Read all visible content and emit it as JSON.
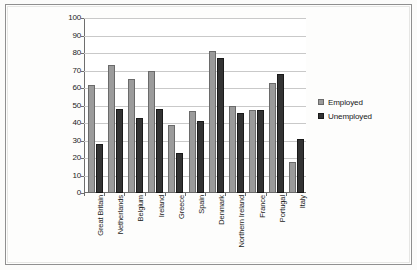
{
  "chart_data": {
    "type": "bar",
    "title": "",
    "xlabel": "",
    "ylabel": "",
    "ylim": [
      0,
      100
    ],
    "ytick_step": 10,
    "yticks": [
      100,
      90,
      80,
      70,
      60,
      50,
      40,
      30,
      20,
      10,
      0
    ],
    "grid": true,
    "legend_position": "right",
    "orientation": "vertical",
    "grouping": "clustered",
    "categories": [
      "Great Britain",
      "Netherlands",
      "Belgium",
      "Ireland",
      "Greece",
      "Spain",
      "Denmark",
      "Northern Ireland",
      "France",
      "Portugal",
      "Italy"
    ],
    "series": [
      {
        "name": "Employed",
        "color": "#9b9b9b",
        "values": [
          62,
          73,
          65,
          70,
          39,
          47,
          81,
          50,
          47.5,
          63,
          17.5
        ]
      },
      {
        "name": "Unemployed",
        "color": "#333333",
        "values": [
          28,
          48,
          43,
          48,
          23,
          41,
          77,
          46,
          47.5,
          68,
          31
        ]
      }
    ]
  },
  "legend": {
    "entries": [
      {
        "label": "Employed",
        "swatch": "employed"
      },
      {
        "label": "Unemployed",
        "swatch": "unemployed"
      }
    ]
  },
  "colors": {
    "employed": "#9b9b9b",
    "unemployed": "#333333",
    "axis": "#6e6e6e",
    "gridline": "#c9c9c9",
    "frame": "#8f8f8f",
    "page_background": "#fbfbfa"
  }
}
